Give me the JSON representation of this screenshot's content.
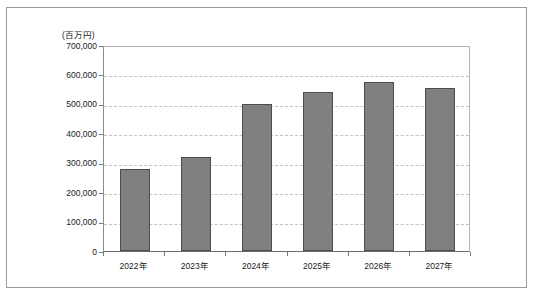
{
  "chart_data": {
    "type": "bar",
    "title": "",
    "subtitle": "",
    "unit_label": "(百万円)",
    "xlabel": "",
    "ylabel": "",
    "categories": [
      "2022年",
      "2023年",
      "2024年",
      "2025年",
      "2026年",
      "2027年"
    ],
    "values": [
      277000,
      320000,
      500000,
      540000,
      575000,
      555000
    ],
    "series": [
      {
        "name": "市場規模",
        "values": [
          277000,
          320000,
          500000,
          540000,
          575000,
          555000
        ]
      }
    ],
    "ylim": [
      0,
      700000
    ],
    "ytick_values": [
      0,
      100000,
      200000,
      300000,
      400000,
      500000,
      600000,
      700000
    ],
    "ytick_labels": [
      "0",
      "100,000",
      "200,000",
      "300,000",
      "400,000",
      "500,000",
      "600,000",
      "700,000"
    ],
    "grid": true,
    "grid_axis": "y",
    "grid_style": "dashed",
    "legend": false,
    "legend_position": "none",
    "bar_color": "#808080",
    "bar_edge_color": "#4d4d4d",
    "grid_color": "#c3c3c3",
    "axis_color": "#6e6e6e",
    "frame_color": "#9a9a9a",
    "background_color": "#ffffff",
    "annotations": []
  }
}
